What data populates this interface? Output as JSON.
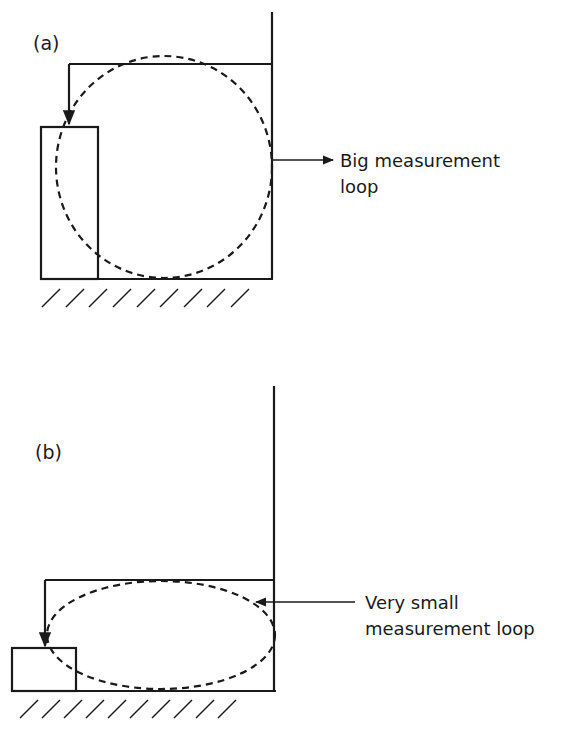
{
  "figure": {
    "panel_a": {
      "label": "(a)",
      "annotation_line1": "Big measurement",
      "annotation_line2": "loop",
      "loop_type": "circle-dashed"
    },
    "panel_b": {
      "label": "(b)",
      "annotation_line1": "Very small",
      "annotation_line2": "measurement loop",
      "loop_type": "ellipse-dashed"
    },
    "colors": {
      "ink": "#1a1a1a",
      "background": "#ffffff"
    }
  }
}
